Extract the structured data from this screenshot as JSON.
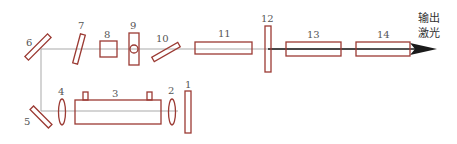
{
  "diagram": {
    "title": "",
    "output_label_line1": "输出",
    "output_label_line2": "激光",
    "colors": {
      "component_stroke": "#9b3a33",
      "beam": "#a9a9a9",
      "output_beam": "#1a1a1a"
    },
    "components": [
      {
        "id": "1",
        "label": "1",
        "shape": "plate"
      },
      {
        "id": "2",
        "label": "2",
        "shape": "lens"
      },
      {
        "id": "3",
        "label": "3",
        "shape": "gain-tube"
      },
      {
        "id": "4",
        "label": "4",
        "shape": "lens"
      },
      {
        "id": "5",
        "label": "5",
        "shape": "mirror-45"
      },
      {
        "id": "6",
        "label": "6",
        "shape": "mirror-45"
      },
      {
        "id": "7",
        "label": "7",
        "shape": "tilted-plate"
      },
      {
        "id": "8",
        "label": "8",
        "shape": "square"
      },
      {
        "id": "9",
        "label": "9",
        "shape": "plate-with-circle"
      },
      {
        "id": "10",
        "label": "10",
        "shape": "tilted-plate"
      },
      {
        "id": "11",
        "label": "11",
        "shape": "rod"
      },
      {
        "id": "12",
        "label": "12",
        "shape": "plate"
      },
      {
        "id": "13",
        "label": "13",
        "shape": "rod"
      },
      {
        "id": "14",
        "label": "14",
        "shape": "rod"
      }
    ]
  }
}
